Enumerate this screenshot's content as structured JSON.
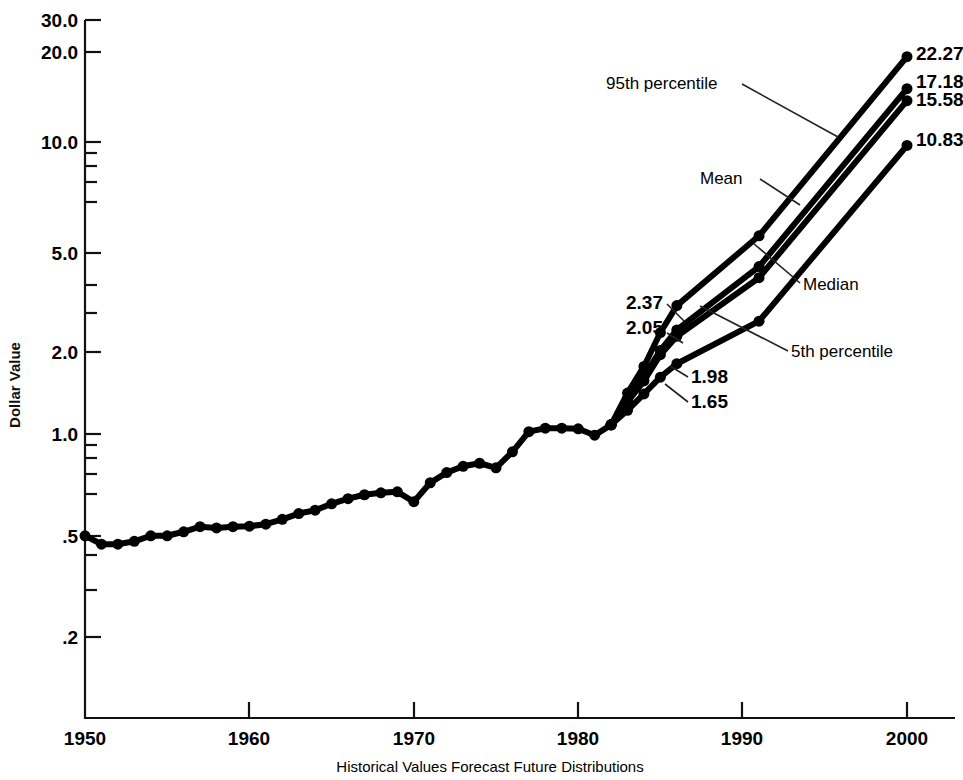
{
  "chart_data": {
    "type": "line",
    "title": "",
    "xlabel": "Historical Values Forecast Future Distributions",
    "ylabel": "Dollar Value",
    "yscale": "log",
    "ylim": [
      0.15,
      30.0
    ],
    "xlim": [
      1950,
      2002
    ],
    "grid": false,
    "legend_position": "inline-annotations",
    "y_ticks_major": [
      "30.0",
      "20.0",
      "10.0",
      "5.0",
      "2.0",
      "1.0",
      ".5",
      ".2"
    ],
    "y_tick_values": [
      30.0,
      20.0,
      10.0,
      5.0,
      2.0,
      1.0,
      0.5,
      0.2
    ],
    "y_ticks_minor": [
      9.0,
      8.0,
      7.0,
      6.0,
      4.0,
      3.0,
      0.9,
      0.8,
      0.7,
      0.6,
      0.4,
      0.3
    ],
    "x_ticks": [
      "1950",
      "1960",
      "1970",
      "1980",
      "1990",
      "2000"
    ],
    "x_tick_values": [
      1950,
      1960,
      1970,
      1980,
      1990,
      2000
    ],
    "series": [
      {
        "name": "Historical Values",
        "marker": "filled-circle",
        "x": [
          1950,
          1951,
          1952,
          1953,
          1954,
          1955,
          1956,
          1957,
          1958,
          1959,
          1960,
          1961,
          1962,
          1963,
          1964,
          1965,
          1966,
          1967,
          1968,
          1969,
          1970,
          1971,
          1972,
          1973,
          1974,
          1975,
          1976,
          1977,
          1978,
          1979,
          1980,
          1981,
          1982
        ],
        "y": [
          0.455,
          0.425,
          0.425,
          0.435,
          0.455,
          0.455,
          0.47,
          0.49,
          0.485,
          0.49,
          0.492,
          0.5,
          0.52,
          0.545,
          0.56,
          0.59,
          0.615,
          0.635,
          0.645,
          0.65,
          0.6,
          0.7,
          0.76,
          0.8,
          0.82,
          0.79,
          0.9,
          1.06,
          1.09,
          1.09,
          1.085,
          1.03,
          1.12
        ]
      },
      {
        "name": "95th percentile",
        "marker": "filled-circle",
        "endpoint_label": "22.27",
        "x": [
          1982,
          1983,
          1984,
          1985,
          1986,
          1991,
          2000
        ],
        "y": [
          1.12,
          1.45,
          1.8,
          2.37,
          2.95,
          5.2,
          22.27
        ]
      },
      {
        "name": "Mean",
        "marker": "filled-circle",
        "endpoint_label": "17.18",
        "x": [
          1982,
          1983,
          1984,
          1985,
          1986,
          1991,
          2000
        ],
        "y": [
          1.12,
          1.38,
          1.66,
          2.05,
          2.42,
          4.05,
          17.18
        ]
      },
      {
        "name": "Median",
        "marker": "filled-circle",
        "endpoint_label": "15.58",
        "x": [
          1982,
          1983,
          1984,
          1985,
          1986,
          1991,
          2000
        ],
        "y": [
          1.12,
          1.35,
          1.6,
          1.98,
          2.3,
          3.7,
          15.58
        ]
      },
      {
        "name": "5th percentile",
        "marker": "filled-circle",
        "endpoint_label": "10.83",
        "x": [
          1982,
          1983,
          1984,
          1985,
          1986,
          1991,
          2000
        ],
        "y": [
          1.12,
          1.26,
          1.44,
          1.65,
          1.84,
          2.6,
          10.83
        ]
      }
    ],
    "annotations": [
      {
        "text": "95th percentile",
        "kind": "series-label"
      },
      {
        "text": "Mean",
        "kind": "series-label"
      },
      {
        "text": "Median",
        "kind": "series-label"
      },
      {
        "text": "5th percentile",
        "kind": "series-label"
      },
      {
        "text": "2.37",
        "kind": "data-label"
      },
      {
        "text": "2.05",
        "kind": "data-label"
      },
      {
        "text": "1.98",
        "kind": "data-label"
      },
      {
        "text": "1.65",
        "kind": "data-label"
      },
      {
        "text": "22.27",
        "kind": "endpoint-label"
      },
      {
        "text": "17.18",
        "kind": "endpoint-label"
      },
      {
        "text": "15.58",
        "kind": "endpoint-label"
      },
      {
        "text": "10.83",
        "kind": "endpoint-label"
      }
    ],
    "colors": {
      "line": "#000000",
      "axis": "#111111",
      "background": "#ffffff"
    }
  },
  "axis": {
    "y_title": "Dollar Value",
    "x_caption": "Historical Values Forecast Future Distributions",
    "yticks": [
      {
        "label": "30.0"
      },
      {
        "label": "20.0"
      },
      {
        "label": "10.0"
      },
      {
        "label": "5.0"
      },
      {
        "label": "2.0"
      },
      {
        "label": "1.0"
      },
      {
        "label": ".5"
      },
      {
        "label": ".2"
      }
    ],
    "xticks": [
      {
        "label": "1950"
      },
      {
        "label": "1960"
      },
      {
        "label": "1970"
      },
      {
        "label": "1980"
      },
      {
        "label": "1990"
      },
      {
        "label": "2000"
      }
    ]
  },
  "labels": {
    "p95": "95th percentile",
    "mean": "Mean",
    "median": "Median",
    "p5": "5th percentile",
    "v2_37": "2.37",
    "v2_05": "2.05",
    "v1_98": "1.98",
    "v1_65": "1.65",
    "end_p95": "22.27",
    "end_mean": "17.18",
    "end_median": "15.58",
    "end_p5": "10.83"
  }
}
